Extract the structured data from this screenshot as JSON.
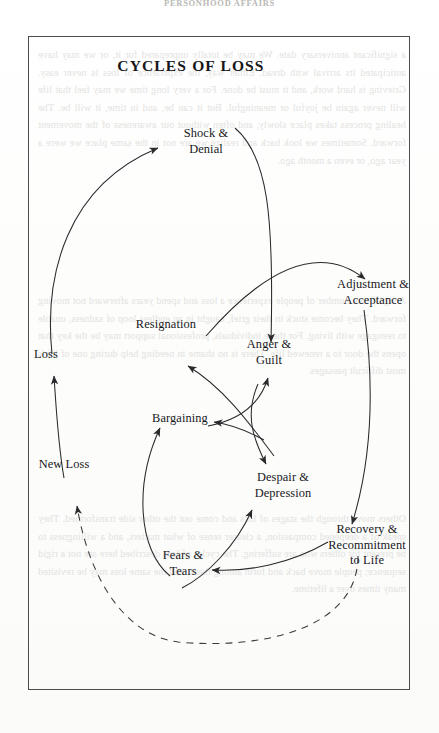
{
  "page": {
    "running_head": "PERSONHOOD AFFAIRS",
    "bleed_text_1": "a significant anniversary date. We may be totally unprepared for it, or we may have anticipated its arrival with dread. Either way, the experience of loss is never easy. Grieving is hard work, and it must be done. For a very long time we may feel that life will never again be joyful or meaningful. But it can be, and in time, it will be. The healing process takes place slowly, and often without our awareness of the movement forward. Sometimes we look back and realize we are not in the same place we were a year ago, or even a month ago.",
    "bleed_text_2": "A significant number of people experience a loss and spend years afterward not moving forward. They become stuck in their grief, caught in an endless loop of sadness, unable to reengage with living. For these individuals, professional support may be the key that opens the door to a renewed life. There is no shame in needing help during one of life's most difficult passages.",
    "bleed_text_3": "Others move through the stages of loss and come out the other side transformed. They speak of a deepened compassion, a clearer sense of what matters, and a willingness to be present for others who are suffering. The cycles of loss described here are not a rigid sequence; people move back and forth among them, and the same loss may be revisited many times over a lifetime."
  },
  "figure": {
    "title": "CYCLES OF LOSS",
    "nodes": [
      {
        "id": "shock-denial",
        "label": "Shock &\nDenial"
      },
      {
        "id": "adjustment-acceptance",
        "label": "Adjustment &\nAcceptance"
      },
      {
        "id": "resignation",
        "label": "Resignation"
      },
      {
        "id": "anger-guilt",
        "label": "Anger &\nGuilt"
      },
      {
        "id": "loss",
        "label": "Loss"
      },
      {
        "id": "bargaining",
        "label": "Bargaining"
      },
      {
        "id": "new-loss",
        "label": "New Loss"
      },
      {
        "id": "despair-depression",
        "label": "Despair &\nDepression"
      },
      {
        "id": "recovery-recommitment",
        "label": "Recovery &\nRecommitment\nto Life"
      },
      {
        "id": "fears-tears",
        "label": "Fears &\nTears"
      }
    ],
    "edges": [
      {
        "from": "loss",
        "to": "shock-denial",
        "style": "solid"
      },
      {
        "from": "shock-denial",
        "to": "anger-guilt",
        "style": "solid"
      },
      {
        "from": "resignation",
        "to": "adjustment-acceptance",
        "style": "solid"
      },
      {
        "from": "adjustment-acceptance",
        "to": "recovery-recommitment",
        "style": "solid"
      },
      {
        "from": "bargaining",
        "to": "anger-guilt",
        "style": "solid"
      },
      {
        "from": "anger-guilt",
        "to": "despair-depression",
        "style": "solid"
      },
      {
        "from": "despair-depression",
        "to": "resignation",
        "style": "solid"
      },
      {
        "from": "despair-depression",
        "to": "bargaining",
        "style": "solid"
      },
      {
        "from": "recovery-recommitment",
        "to": "fears-tears",
        "style": "solid"
      },
      {
        "from": "despair-depression",
        "to": "fears-tears",
        "style": "solid"
      },
      {
        "from": "fears-tears",
        "to": "bargaining",
        "style": "solid"
      },
      {
        "from": "new-loss",
        "to": "loss",
        "style": "solid"
      },
      {
        "from": "recovery-recommitment",
        "to": "new-loss",
        "style": "dashed"
      }
    ]
  },
  "colors": {
    "ink": "#18181b",
    "rule": "#4c4c4c",
    "arrow": "#2a2a2c",
    "paper": "#fcfcfb",
    "bleed": "#e3e2e0"
  }
}
